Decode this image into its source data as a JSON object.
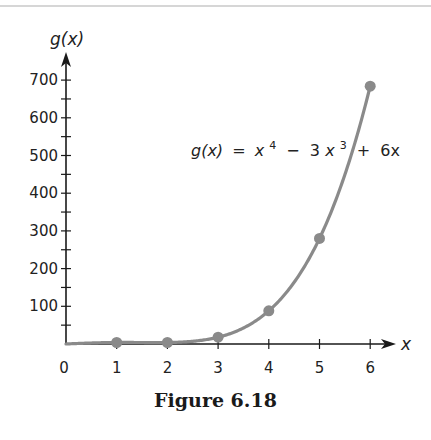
{
  "caption": "Figure 6.18",
  "chart_data": {
    "type": "line",
    "title": "",
    "function_label": {
      "lhs": "g(x)",
      "eq": "=",
      "t1_base": "x",
      "t1_exp": "4",
      "op1": "−",
      "t2_coef": "3",
      "t2_base": "x",
      "t2_exp": "3",
      "op2": "+",
      "t3": "6x"
    },
    "xlabel": "x",
    "ylabel": "g(x)",
    "x_ticks": [
      1,
      2,
      3,
      4,
      5,
      6
    ],
    "x_origin_label": "0",
    "y_ticks_labeled": [
      100,
      200,
      300,
      400,
      500,
      600,
      700
    ],
    "y_minor_step": 50,
    "xlim": [
      0,
      6.5
    ],
    "ylim": [
      0,
      760
    ],
    "grid": false,
    "series": [
      {
        "name": "g(x) = x^4 - 3x^3 + 6x",
        "x": [
          0,
          1,
          2,
          3,
          4,
          5,
          6
        ],
        "values": [
          0,
          4,
          4,
          18,
          88,
          280,
          684
        ],
        "marked_points_x": [
          1,
          2,
          3,
          4,
          5,
          6
        ],
        "color": "#8a8a8a"
      }
    ]
  },
  "colors": {
    "axis": "#1a1a1a",
    "curve": "#8a8a8a",
    "point": "#8a8a8a"
  }
}
